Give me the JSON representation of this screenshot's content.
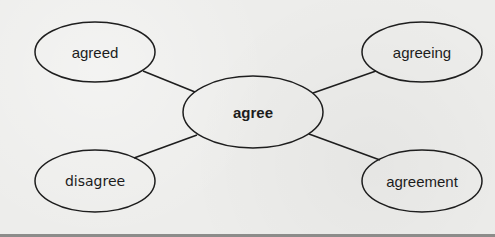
{
  "diagram": {
    "type": "word-web",
    "center": {
      "id": "agree",
      "label": "agree",
      "cx": 253,
      "cy": 112,
      "rx": 70,
      "ry": 36
    },
    "nodes": [
      {
        "id": "agreed",
        "label": "agreed",
        "cx": 95,
        "cy": 52,
        "rx": 60,
        "ry": 30
      },
      {
        "id": "agreeing",
        "label": "agreeing",
        "cx": 422,
        "cy": 52,
        "rx": 60,
        "ry": 30
      },
      {
        "id": "disagree",
        "label": "disagree",
        "cx": 95,
        "cy": 181,
        "rx": 60,
        "ry": 31
      },
      {
        "id": "agreement",
        "label": "agreement",
        "cx": 422,
        "cy": 181,
        "rx": 60,
        "ry": 31
      }
    ],
    "edges": [
      {
        "from": "agreed",
        "to": "agree",
        "x1": 143,
        "y1": 71,
        "x2": 195,
        "y2": 92
      },
      {
        "from": "agreeing",
        "to": "agree",
        "x1": 376,
        "y1": 71,
        "x2": 313,
        "y2": 93
      },
      {
        "from": "disagree",
        "to": "agree",
        "x1": 134,
        "y1": 158,
        "x2": 197,
        "y2": 135
      },
      {
        "from": "agreement",
        "to": "agree",
        "x1": 380,
        "y1": 160,
        "x2": 309,
        "y2": 134
      }
    ],
    "colors": {
      "stroke": "#1e1e1e",
      "text": "#1c1c1c",
      "background": "#ededeb",
      "bottom_rule": "#8c8c8a"
    }
  }
}
